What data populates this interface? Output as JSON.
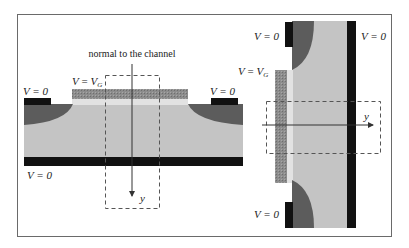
{
  "figure": {
    "type": "MOSFET cross-section diagrams",
    "colors": {
      "background": "#ffffff",
      "frame": "#6a6a6a",
      "substrate": "#c4c4c4",
      "oxide": "#e4e4e4",
      "gate": "#8a8a8a",
      "contact": "#111111",
      "doped_region": "#5c5c5c",
      "dashed_box": "#555555",
      "axis_arrow": "#333333"
    }
  },
  "left_panel": {
    "caption": "normal to the channel",
    "gate_label_v": "V",
    "gate_label_eq": " = ",
    "gate_label_vg": "V",
    "gate_label_sub": "G",
    "source_label": "V = 0",
    "drain_label": "V = 0",
    "body_label": "V = 0",
    "axis_label": "y"
  },
  "right_panel": {
    "gate_label_v": "V",
    "gate_label_eq": " = ",
    "gate_label_vg": "V",
    "gate_label_sub": "G",
    "top_contact_label": "V = 0",
    "bottom_contact_label": "V = 0",
    "body_label": "V = 0",
    "axis_label": "y"
  }
}
